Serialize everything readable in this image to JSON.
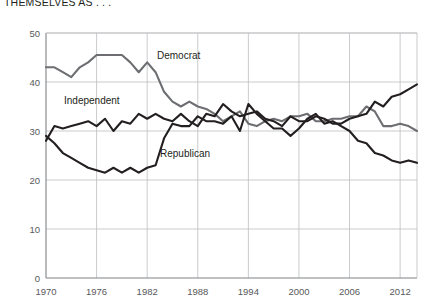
{
  "title": {
    "line1": "PERCENTAGE OF AMERICANS WHO IDENTIFY",
    "line2": "THEMSELVES AS . . ."
  },
  "colors": {
    "democrat": "#6d6e71",
    "independent": "#231f20",
    "republican": "#231f20",
    "grid": "#bcbec0",
    "axis": "#808285",
    "tick_text": "#58595b",
    "label_text": "#231f20",
    "background": "#ffffff"
  },
  "annotations": {
    "democrat": "Democrat",
    "independent": "Independent",
    "republican": "Republican"
  },
  "chart_data": {
    "type": "line",
    "title": "PERCENTAGE OF AMERICANS WHO IDENTIFY THEMSELVES AS . . .",
    "xlabel": "",
    "ylabel": "",
    "xlim": [
      1970,
      2014
    ],
    "ylim": [
      0,
      50
    ],
    "yticks": [
      0,
      10,
      20,
      30,
      40,
      50
    ],
    "xticks": [
      1970,
      1976,
      1982,
      1988,
      1994,
      2000,
      2006,
      2012
    ],
    "grid": true,
    "legend": "inline-annotations",
    "x": [
      1970,
      1971,
      1972,
      1973,
      1974,
      1975,
      1976,
      1977,
      1978,
      1979,
      1980,
      1981,
      1982,
      1983,
      1984,
      1985,
      1986,
      1987,
      1988,
      1989,
      1990,
      1991,
      1992,
      1993,
      1994,
      1995,
      1996,
      1997,
      1998,
      1999,
      2000,
      2001,
      2002,
      2003,
      2004,
      2005,
      2006,
      2007,
      2008,
      2009,
      2010,
      2011,
      2012,
      2013,
      2014
    ],
    "series": [
      {
        "name": "Democrat",
        "color": "#6d6e71",
        "values": [
          43,
          43,
          42,
          41,
          43,
          44,
          45.5,
          45.5,
          45.5,
          45.5,
          44,
          42,
          44,
          42,
          38,
          36,
          35,
          36,
          35,
          34.5,
          33.5,
          32,
          33,
          34,
          31.5,
          31,
          32,
          32.5,
          32,
          33,
          33,
          33.5,
          32,
          32,
          32.5,
          32.5,
          33,
          33,
          35,
          34,
          31,
          31,
          31.5,
          31,
          30
        ]
      },
      {
        "name": "Independent",
        "color": "#231f20",
        "values": [
          28,
          31,
          30.5,
          31,
          31.5,
          32,
          31,
          32.5,
          30,
          32,
          31.5,
          33.5,
          32.5,
          33.5,
          32.5,
          32,
          33.5,
          32,
          31,
          33.5,
          33,
          35.5,
          34,
          33,
          33.5,
          34,
          32.5,
          32,
          31,
          33,
          32,
          32,
          33,
          32.5,
          31.5,
          31.5,
          32.5,
          33,
          33.5,
          36,
          35,
          37,
          37.5,
          38.5,
          39.5
        ]
      },
      {
        "name": "Republican",
        "color": "#231f20",
        "values": [
          29,
          27.5,
          25.5,
          24.5,
          23.5,
          22.5,
          22,
          21.5,
          22.5,
          21.5,
          22.5,
          21.5,
          22.5,
          23,
          28.5,
          31.5,
          31,
          31,
          33,
          32,
          32,
          31.5,
          33,
          30,
          35.5,
          33.5,
          32,
          30.5,
          30.5,
          29,
          30.5,
          32.5,
          33.5,
          31.5,
          32,
          31,
          30,
          28,
          27.5,
          25.5,
          25,
          24,
          23.5,
          24,
          23.5
        ]
      }
    ]
  }
}
